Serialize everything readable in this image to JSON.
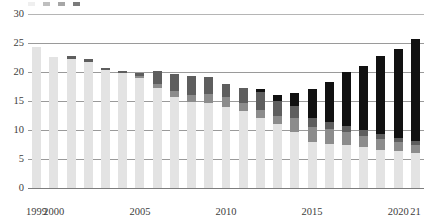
{
  "chart_data": {
    "type": "bar",
    "stacked": true,
    "title": "",
    "subtitle": "",
    "xlabel": "",
    "ylabel": "",
    "ylim": [
      0,
      30
    ],
    "ytick_step": 5,
    "yticks": [
      "0",
      "5",
      "10",
      "15",
      "20",
      "25",
      "30"
    ],
    "grid": true,
    "legend_position": "top",
    "legend_clipped": true,
    "categories": [
      "1999",
      "2000",
      "2001",
      "2002",
      "2003",
      "2004",
      "2005",
      "2006",
      "2007",
      "2008",
      "2009",
      "2010",
      "2011",
      "2012",
      "2013",
      "2014",
      "2015",
      "2016",
      "2017",
      "2018",
      "2019",
      "2020",
      "2021"
    ],
    "xtick_labels": [
      "1999",
      "2000",
      "2005",
      "2010",
      "2015",
      "2020",
      "21"
    ],
    "xtick_categories": [
      "1999",
      "2000",
      "2005",
      "2010",
      "2015",
      "2020",
      "2021"
    ],
    "series": [
      {
        "name": "series-1",
        "color": "#e3e3e3",
        "values": [
          24.3,
          22.6,
          22.2,
          21.8,
          20.4,
          19.9,
          19.0,
          17.3,
          15.7,
          14.8,
          14.6,
          14.0,
          13.2,
          12.0,
          11.0,
          9.7,
          8.0,
          7.6,
          7.4,
          7.0,
          6.6,
          6.3,
          6.0
        ]
      },
      {
        "name": "series-2",
        "color": "#8c8c8c",
        "values": [
          0.0,
          0.0,
          0.0,
          0.0,
          0.0,
          0.0,
          0.3,
          0.7,
          1.1,
          1.3,
          1.6,
          1.7,
          1.5,
          1.5,
          1.4,
          2.3,
          2.6,
          2.5,
          2.2,
          2.0,
          1.8,
          1.6,
          1.4
        ]
      },
      {
        "name": "series-3",
        "color": "#5e5e5e",
        "values": [
          0.0,
          0.0,
          0.5,
          0.4,
          0.3,
          0.3,
          0.6,
          2.1,
          2.8,
          3.3,
          2.9,
          2.3,
          2.6,
          3.0,
          2.6,
          2.1,
          1.5,
          1.3,
          1.1,
          1.0,
          0.9,
          0.8,
          0.7
        ]
      },
      {
        "name": "series-4",
        "color": "#111111",
        "values": [
          0.0,
          0.0,
          0.0,
          0.0,
          0.0,
          0.0,
          0.0,
          0.0,
          0.0,
          0.0,
          0.0,
          0.0,
          0.0,
          0.6,
          1.0,
          2.3,
          5.0,
          6.9,
          9.3,
          11.0,
          13.4,
          15.3,
          17.6
        ]
      }
    ],
    "totals": [
      24.3,
      22.6,
      22.7,
      22.2,
      20.7,
      20.2,
      19.9,
      20.1,
      19.6,
      19.4,
      19.1,
      18.0,
      17.3,
      17.1,
      16.0,
      16.4,
      17.1,
      18.3,
      20.0,
      21.0,
      22.7,
      24.0,
      25.7
    ]
  },
  "legend": {
    "items": [
      {
        "label": "",
        "color": "#e3e3e3"
      },
      {
        "label": "",
        "color": "#8c8c8c"
      },
      {
        "label": "",
        "color": "#5e5e5e"
      },
      {
        "label": "",
        "color": "#111111"
      }
    ]
  }
}
